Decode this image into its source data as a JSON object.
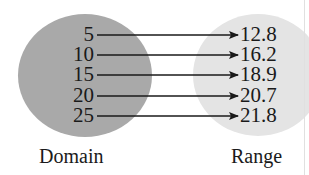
{
  "diagram": {
    "type": "mapping",
    "domain": {
      "label": "Domain",
      "values": [
        "5",
        "10",
        "15",
        "20",
        "25"
      ],
      "color": "#a9a9a9"
    },
    "range": {
      "label": "Range",
      "values": [
        "12.8",
        "16.2",
        "18.9",
        "20.7",
        "21.8"
      ],
      "color": "#e4e4e4"
    },
    "mappings": [
      {
        "from": "5",
        "to": "12.8"
      },
      {
        "from": "10",
        "to": "16.2"
      },
      {
        "from": "15",
        "to": "18.9"
      },
      {
        "from": "20",
        "to": "20.7"
      },
      {
        "from": "25",
        "to": "21.8"
      }
    ],
    "arrow_color": "#1a1a1a"
  }
}
